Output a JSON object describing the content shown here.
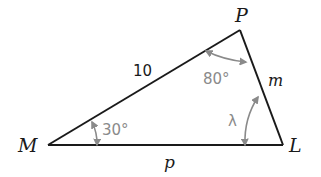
{
  "diagram": {
    "type": "triangle",
    "vertices": {
      "M": {
        "label": "M"
      },
      "P": {
        "label": "P"
      },
      "L": {
        "label": "L"
      }
    },
    "sides": {
      "MP": {
        "label": "10"
      },
      "PL": {
        "label": "m"
      },
      "ML": {
        "label": "p"
      }
    },
    "angles": {
      "M": {
        "label": "30°"
      },
      "P": {
        "label": "80°"
      },
      "L": {
        "label": "λ"
      }
    },
    "colors": {
      "edge": "#1a1a1a",
      "angle_marker": "#8a8a8a"
    }
  }
}
